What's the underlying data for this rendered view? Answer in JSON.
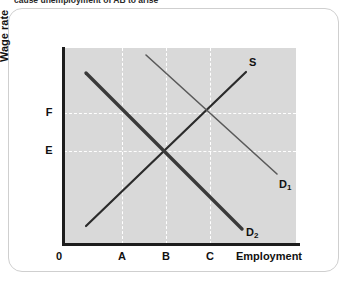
{
  "caption": {
    "text": "cause unemployment of AB to arise"
  },
  "figure": {
    "y_axis_title": "Wage rate",
    "x_axis_title": "Employment",
    "origin_label": "0",
    "y_ticks": [
      {
        "label": "F",
        "y": 113
      },
      {
        "label": "E",
        "y": 151
      }
    ],
    "x_ticks": [
      {
        "label": "A",
        "x": 122
      },
      {
        "label": "B",
        "x": 166
      },
      {
        "label": "C",
        "x": 210
      }
    ],
    "curves": [
      {
        "name": "supply",
        "label": "S",
        "label_x": 249,
        "label_y": 56,
        "x1": 86,
        "y1": 226,
        "x2": 246,
        "y2": 72,
        "color": "#2b2b2b",
        "width": 2.2
      },
      {
        "name": "demand-1",
        "label": "D",
        "label_sub": "1",
        "label_x": 279,
        "label_y": 178,
        "x1": 146,
        "y1": 55,
        "x2": 277,
        "y2": 174,
        "color": "#5a5a5a",
        "width": 1.6
      },
      {
        "name": "demand-2",
        "label": "D",
        "label_sub": "2",
        "label_x": 246,
        "label_y": 226,
        "x1": 86,
        "y1": 73,
        "x2": 242,
        "y2": 229,
        "color": "#3a3a3a",
        "width": 3.4
      }
    ],
    "colors": {
      "plot_background": "#d9d9d9",
      "axis": "#1d1d1d",
      "gridline": "#ffffff",
      "card_border": "#cfcfcf",
      "page_background": "#ffffff"
    },
    "plot_box": {
      "left": 64,
      "top": 48,
      "width": 232,
      "height": 196
    }
  }
}
